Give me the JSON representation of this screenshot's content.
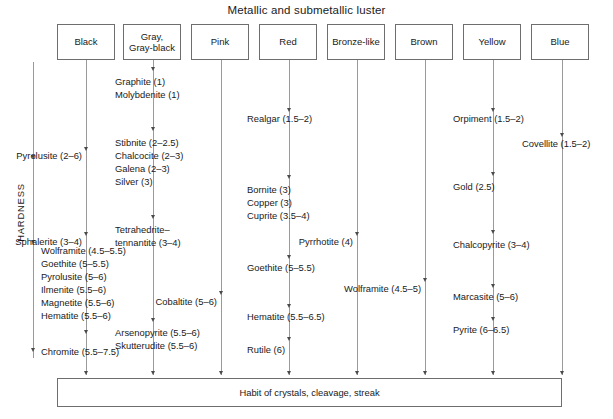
{
  "figure": {
    "title": "Metallic and submetallic luster",
    "axis_label": "HARDNESS",
    "footer": "Habit of crystals, cleavage, streak",
    "line_color": "#9a9a9a",
    "arrow_color": "#4a4a4a",
    "box_border_color": "#6e6e6e",
    "text_color": "#1a1a1a",
    "background": "#ffffff"
  },
  "columns": [
    {
      "id": "black",
      "header": "Black",
      "header_lines": [
        "Black"
      ],
      "items": [
        {
          "text": "Pyrolusite (2–6)",
          "mineral": "Pyrolusite",
          "hardness": "2–6"
        },
        {
          "text": "Sphalerite (3–4)",
          "mineral": "Sphalerite",
          "hardness": "3–4"
        },
        {
          "text": "Wolframite (4.5–5.5)",
          "mineral": "Wolframite",
          "hardness": "4.5–5.5"
        },
        {
          "text": "Goethite (5–5.5)",
          "mineral": "Goethite",
          "hardness": "5–5.5"
        },
        {
          "text": "Pyrolusite (5–6)",
          "mineral": "Pyrolusite",
          "hardness": "5–6"
        },
        {
          "text": "Ilmenite (5.5–6)",
          "mineral": "Ilmenite",
          "hardness": "5.5–6"
        },
        {
          "text": "Magnetite (5.5–6)",
          "mineral": "Magnetite",
          "hardness": "5.5–6"
        },
        {
          "text": "Hematite (5.5–6)",
          "mineral": "Hematite",
          "hardness": "5.5–6"
        },
        {
          "text": "Chromite (5.5–7.5)",
          "mineral": "Chromite",
          "hardness": "5.5–7.5"
        }
      ]
    },
    {
      "id": "gray",
      "header": "Gray, Gray-black",
      "header_lines": [
        "Gray,",
        "Gray-black"
      ],
      "items": [
        {
          "text": "Graphite (1)",
          "mineral": "Graphite",
          "hardness": "1"
        },
        {
          "text": "Molybdenite (1)",
          "mineral": "Molybdenite",
          "hardness": "1"
        },
        {
          "text": "Stibnite (2–2.5)",
          "mineral": "Stibnite",
          "hardness": "2–2.5"
        },
        {
          "text": "Chalcocite (2–3)",
          "mineral": "Chalcocite",
          "hardness": "2–3"
        },
        {
          "text": "Galena (2–3)",
          "mineral": "Galena",
          "hardness": "2–3"
        },
        {
          "text": "Silver (3)",
          "mineral": "Silver",
          "hardness": "3"
        },
        {
          "text": "Tetrahedrite–",
          "mineral": "Tetrahedrite–tennantite",
          "hardness": "3–4"
        },
        {
          "text": "tennantite (3–4)",
          "mineral": "Tetrahedrite–tennantite",
          "hardness": "3–4"
        },
        {
          "text": "Arsenopyrite (5.5–6)",
          "mineral": "Arsenopyrite",
          "hardness": "5.5–6"
        },
        {
          "text": "Skutterudite (5.5–6)",
          "mineral": "Skutterudite",
          "hardness": "5.5–6"
        }
      ]
    },
    {
      "id": "pink",
      "header": "Pink",
      "header_lines": [
        "Pink"
      ],
      "items": [
        {
          "text": "Cobaltite (5–6)",
          "mineral": "Cobaltite",
          "hardness": "5–6"
        }
      ]
    },
    {
      "id": "red",
      "header": "Red",
      "header_lines": [
        "Red"
      ],
      "items": [
        {
          "text": "Realgar (1.5–2)",
          "mineral": "Realgar",
          "hardness": "1.5–2"
        },
        {
          "text": "Bornite (3)",
          "mineral": "Bornite",
          "hardness": "3"
        },
        {
          "text": "Copper (3)",
          "mineral": "Copper",
          "hardness": "3"
        },
        {
          "text": "Cuprite (3.5–4)",
          "mineral": "Cuprite",
          "hardness": "3.5–4"
        },
        {
          "text": "Goethite (5–5.5)",
          "mineral": "Goethite",
          "hardness": "5–5.5"
        },
        {
          "text": "Hematite (5.5–6.5)",
          "mineral": "Hematite",
          "hardness": "5.5–6.5"
        },
        {
          "text": "Rutile (6)",
          "mineral": "Rutile",
          "hardness": "6"
        }
      ]
    },
    {
      "id": "bronze-like",
      "header": "Bronze-like",
      "header_lines": [
        "Bronze-like"
      ],
      "items": [
        {
          "text": "Pyrrhotite (4)",
          "mineral": "Pyrrhotite",
          "hardness": "4"
        }
      ]
    },
    {
      "id": "brown",
      "header": "Brown",
      "header_lines": [
        "Brown"
      ],
      "items": [
        {
          "text": "Wolframite (4.5–5)",
          "mineral": "Wolframite",
          "hardness": "4.5–5"
        }
      ]
    },
    {
      "id": "yellow",
      "header": "Yellow",
      "header_lines": [
        "Yellow"
      ],
      "items": [
        {
          "text": "Orpiment (1.5–2)",
          "mineral": "Orpiment",
          "hardness": "1.5–2"
        },
        {
          "text": "Gold (2.5)",
          "mineral": "Gold",
          "hardness": "2.5"
        },
        {
          "text": "Chalcopyrite (3–4)",
          "mineral": "Chalcopyrite",
          "hardness": "3–4"
        },
        {
          "text": "Marcasite (5–6)",
          "mineral": "Marcasite",
          "hardness": "5–6"
        },
        {
          "text": "Pyrite (6–6.5)",
          "mineral": "Pyrite",
          "hardness": "6–6.5"
        }
      ]
    },
    {
      "id": "blue",
      "header": "Blue",
      "header_lines": [
        "Blue"
      ],
      "items": [
        {
          "text": "Covellite (1.5–2)",
          "mineral": "Covellite",
          "hardness": "1.5–2"
        }
      ]
    }
  ]
}
